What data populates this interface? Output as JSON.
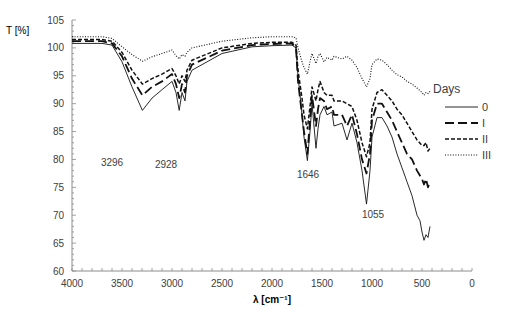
{
  "chart_data": {
    "type": "line",
    "title": "",
    "xlabel": "λ [cm⁻¹]",
    "ylabel": "T [%]",
    "xlim": [
      4000,
      0
    ],
    "ylim": [
      60,
      105
    ],
    "x_ticks": [
      4000,
      3500,
      3000,
      2500,
      2000,
      1500,
      1000,
      500,
      0
    ],
    "y_ticks": [
      60,
      65,
      70,
      75,
      80,
      85,
      90,
      95,
      100,
      105
    ],
    "grid": false,
    "legend": {
      "title": "Days",
      "position": "right",
      "entries": [
        "0",
        "I",
        "II",
        "III"
      ]
    },
    "annotations": [
      {
        "text": "3296",
        "x": 3296,
        "y": 86.5
      },
      {
        "text": "2928",
        "x": 2928,
        "y": 86.3
      },
      {
        "text": "1646",
        "x": 1646,
        "y": 76.5
      },
      {
        "text": "1055",
        "x": 1055,
        "y": 68.5
      }
    ],
    "series": [
      {
        "name": "0",
        "style": "solid",
        "x": [
          4000,
          3700,
          3600,
          3500,
          3400,
          3296,
          3200,
          3100,
          3000,
          2960,
          2928,
          2900,
          2870,
          2850,
          2800,
          2500,
          2200,
          2000,
          1800,
          1760,
          1740,
          1700,
          1680,
          1646,
          1620,
          1600,
          1560,
          1540,
          1520,
          1480,
          1450,
          1400,
          1380,
          1300,
          1250,
          1200,
          1150,
          1100,
          1055,
          1020,
          1000,
          950,
          900,
          850,
          800,
          750,
          700,
          650,
          600,
          550,
          520,
          500,
          480,
          460,
          440,
          420
        ],
        "values": [
          100.8,
          100.8,
          100.5,
          97.5,
          93,
          88.8,
          91,
          92.5,
          94,
          92,
          88.8,
          92,
          90.5,
          94,
          96,
          99,
          100.2,
          100.4,
          100.5,
          100,
          95,
          88,
          84,
          79.8,
          85,
          90,
          82,
          85.5,
          88,
          89.5,
          88,
          88.5,
          86,
          86.5,
          83.5,
          86.5,
          83,
          78,
          72,
          78,
          84,
          87.5,
          87.5,
          86,
          84,
          81,
          78.5,
          76,
          73.5,
          70,
          69,
          67,
          65.5,
          66.5,
          66,
          68
        ]
      },
      {
        "name": "I",
        "style": "longdash",
        "x": [
          4000,
          3700,
          3600,
          3500,
          3400,
          3296,
          3200,
          3100,
          3000,
          2960,
          2928,
          2900,
          2870,
          2850,
          2800,
          2500,
          2200,
          2000,
          1800,
          1760,
          1740,
          1700,
          1680,
          1646,
          1620,
          1600,
          1560,
          1540,
          1520,
          1480,
          1450,
          1400,
          1380,
          1300,
          1250,
          1200,
          1150,
          1100,
          1055,
          1020,
          1000,
          950,
          900,
          850,
          800,
          750,
          700,
          650,
          600,
          550,
          500,
          480,
          460,
          440,
          420
        ],
        "values": [
          101.2,
          101.2,
          100.8,
          98.5,
          94.5,
          91.5,
          93,
          94,
          95.3,
          93.5,
          91,
          93.5,
          92,
          95,
          97,
          99.5,
          100.5,
          100.7,
          100.8,
          100,
          94,
          88,
          85,
          81,
          87,
          91.5,
          86,
          89,
          91,
          90.5,
          89,
          89.5,
          88,
          88,
          86,
          88,
          84.5,
          80,
          77.5,
          81,
          87,
          90,
          90,
          88.5,
          87,
          85,
          83,
          81,
          80,
          78,
          76.5,
          75.5,
          76.5,
          75,
          76
        ]
      },
      {
        "name": "II",
        "style": "dash",
        "x": [
          4000,
          3700,
          3600,
          3500,
          3400,
          3296,
          3200,
          3100,
          3000,
          2960,
          2928,
          2900,
          2870,
          2850,
          2800,
          2500,
          2200,
          2000,
          1800,
          1760,
          1740,
          1700,
          1680,
          1646,
          1620,
          1600,
          1560,
          1540,
          1520,
          1480,
          1450,
          1400,
          1380,
          1300,
          1250,
          1200,
          1150,
          1100,
          1055,
          1020,
          1000,
          950,
          900,
          850,
          800,
          750,
          700,
          650,
          600,
          550,
          500,
          480,
          460,
          440,
          420
        ],
        "values": [
          101.5,
          101.5,
          101.2,
          99.2,
          96,
          93.5,
          94.5,
          95.3,
          96.3,
          95,
          93.5,
          95,
          94,
          96,
          97.8,
          100,
          100.8,
          101,
          101,
          100.5,
          96,
          91,
          88,
          85.5,
          89.5,
          93,
          90.5,
          92.5,
          94,
          92,
          91.5,
          91.5,
          90.5,
          90.5,
          90,
          89.5,
          87,
          83,
          80.5,
          83,
          89,
          92,
          92.5,
          91.5,
          90.5,
          89,
          88,
          86.5,
          85,
          83.5,
          82.5,
          82.5,
          83,
          81.5,
          82
        ]
      },
      {
        "name": "III",
        "style": "dot",
        "x": [
          4000,
          3700,
          3600,
          3500,
          3400,
          3296,
          3200,
          3100,
          3000,
          2960,
          2928,
          2900,
          2870,
          2850,
          2800,
          2500,
          2200,
          2000,
          1800,
          1760,
          1740,
          1700,
          1680,
          1646,
          1620,
          1600,
          1560,
          1540,
          1520,
          1480,
          1450,
          1400,
          1380,
          1300,
          1250,
          1200,
          1150,
          1100,
          1055,
          1020,
          1000,
          950,
          900,
          850,
          800,
          750,
          700,
          650,
          600,
          550,
          500,
          480,
          460,
          440,
          420
        ],
        "values": [
          102,
          102,
          101.7,
          100.2,
          98.8,
          97.6,
          98.4,
          99,
          99.6,
          98.6,
          98,
          98.8,
          98.5,
          99.2,
          100,
          101.2,
          101.8,
          102,
          102,
          101.8,
          100,
          97.5,
          96.5,
          95.3,
          97.5,
          99,
          97.2,
          98.5,
          99,
          97.5,
          98.3,
          97.8,
          98.5,
          98,
          98.5,
          97.8,
          96.5,
          94.5,
          93,
          94.5,
          97,
          98,
          97.8,
          97,
          96,
          95.2,
          94.8,
          94,
          93.5,
          92.8,
          92,
          91.5,
          92,
          91.8,
          92.2
        ]
      }
    ]
  }
}
